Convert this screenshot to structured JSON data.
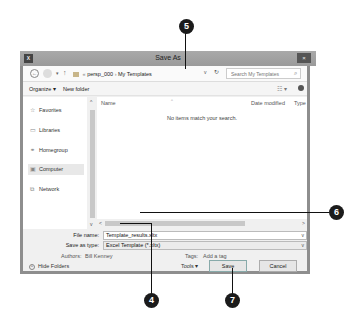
{
  "window": {
    "title": "Save As",
    "app_icon": "excel-icon",
    "close_label": "×"
  },
  "addressbar": {
    "back": "←",
    "forward": "→",
    "recent": "▾",
    "up": "↑",
    "breadcrumbs": [
      "persp_000",
      "My Templates"
    ],
    "breadcrumb_sep": "›",
    "crumb_prefix": "«",
    "dropdown": "v",
    "refresh": "↻",
    "search_placeholder": "Search My Templates",
    "search_icon": "⌕"
  },
  "toolbar": {
    "organize_label": "Organize ▾",
    "new_folder_label": "New folder",
    "views_label": "☷ ▾",
    "help_label": "?"
  },
  "sidebar": {
    "items": [
      {
        "label": "Favorites",
        "icon": "☆"
      },
      {
        "label": "Libraries",
        "icon": "▭"
      },
      {
        "label": "Homegroup",
        "icon": "⚭"
      },
      {
        "label": "Computer",
        "icon": "▣",
        "selected": true
      },
      {
        "label": "Network",
        "icon": "⧉"
      }
    ],
    "scroll_up": "^",
    "scroll_down": "v"
  },
  "filelist": {
    "columns": [
      "Name",
      "Date modified",
      "Type"
    ],
    "empty_message": "No items match your search.",
    "scroll_left": "<",
    "scroll_right": ">"
  },
  "form": {
    "file_name_label": "File name:",
    "file_name_value": "Template_results.xltx",
    "save_type_label": "Save as type:",
    "save_type_value": "Excel Template (*.xltx)",
    "dropdown_arrow": "v",
    "authors_label": "Authors:",
    "authors_value": "Bill Kenney",
    "tags_label": "Tags:",
    "tags_value": "Add a tag"
  },
  "footer": {
    "hide_folders_label": "Hide Folders",
    "hide_folders_icon": "^",
    "tools_label": "Tools  ▾",
    "save_label": "Save",
    "cancel_label": "Cancel"
  },
  "callouts": [
    {
      "number": "5"
    },
    {
      "number": "6"
    },
    {
      "number": "4"
    },
    {
      "number": "7"
    }
  ]
}
